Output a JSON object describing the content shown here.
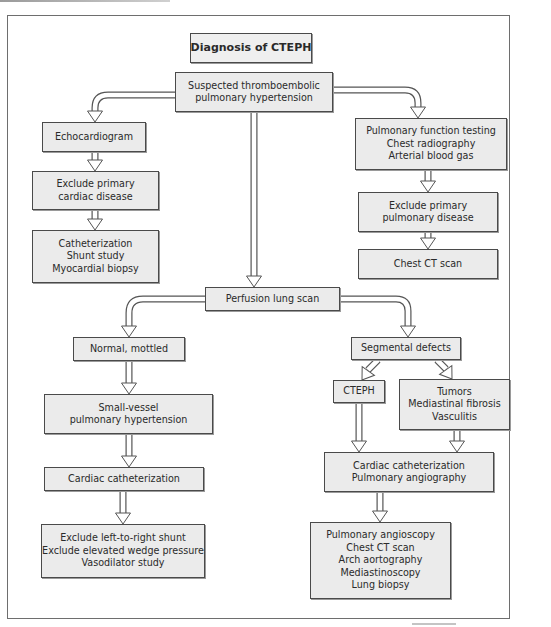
{
  "diagram": {
    "title": "Diagnosis of CTEPH",
    "colors": {
      "box_fill": "#ebebeb",
      "box_border": "#4a4a4a",
      "arrow_stroke": "#555555",
      "arrow_fill": "#ffffff",
      "text": "#2a2a2a"
    },
    "nodes": [
      {
        "id": "title",
        "lines": [
          "Diagnosis of CTEPH"
        ],
        "x": 190,
        "y": 33,
        "w": 122,
        "h": 30
      },
      {
        "id": "suspected",
        "lines": [
          "Suspected thromboembolic",
          "pulmonary hypertension"
        ],
        "x": 175,
        "y": 72,
        "w": 158,
        "h": 40
      },
      {
        "id": "echocardiogram",
        "lines": [
          "Echocardiogram"
        ],
        "x": 42,
        "y": 122,
        "w": 104,
        "h": 30
      },
      {
        "id": "exclude-cardiac",
        "lines": [
          "Exclude primary",
          "cardiac disease"
        ],
        "x": 32,
        "y": 171,
        "w": 127,
        "h": 39
      },
      {
        "id": "catheterization-shunt",
        "lines": [
          "Catheterization",
          "Shunt study",
          "Myocardial biopsy"
        ],
        "x": 32,
        "y": 230,
        "w": 127,
        "h": 53
      },
      {
        "id": "pulmonary-function",
        "lines": [
          "Pulmonary function testing",
          "Chest radiography",
          "Arterial blood gas"
        ],
        "x": 355,
        "y": 118,
        "w": 152,
        "h": 52
      },
      {
        "id": "exclude-pulmonary",
        "lines": [
          "Exclude primary",
          "pulmonary disease"
        ],
        "x": 358,
        "y": 192,
        "w": 140,
        "h": 40
      },
      {
        "id": "chest-ct",
        "lines": [
          "Chest CT scan"
        ],
        "x": 358,
        "y": 249,
        "w": 140,
        "h": 30
      },
      {
        "id": "perfusion-scan",
        "lines": [
          "Perfusion lung scan"
        ],
        "x": 205,
        "y": 287,
        "w": 135,
        "h": 24
      },
      {
        "id": "normal-mottled",
        "lines": [
          "Normal, mottled"
        ],
        "x": 73,
        "y": 337,
        "w": 112,
        "h": 24
      },
      {
        "id": "small-vessel",
        "lines": [
          "Small-vessel",
          "pulmonary hypertension"
        ],
        "x": 44,
        "y": 394,
        "w": 169,
        "h": 40
      },
      {
        "id": "cardiac-cath-left",
        "lines": [
          "Cardiac  catheterization"
        ],
        "x": 44,
        "y": 467,
        "w": 160,
        "h": 24
      },
      {
        "id": "exclude-shunt",
        "lines": [
          "Exclude left-to-right shunt",
          "Exclude elevated wedge pressure",
          "Vasodilator study"
        ],
        "x": 41,
        "y": 524,
        "w": 164,
        "h": 54
      },
      {
        "id": "segmental-defects",
        "lines": [
          "Segmental defects"
        ],
        "x": 351,
        "y": 337,
        "w": 110,
        "h": 23
      },
      {
        "id": "cteph",
        "lines": [
          "CTEPH"
        ],
        "x": 333,
        "y": 380,
        "w": 52,
        "h": 23
      },
      {
        "id": "tumors",
        "lines": [
          "Tumors",
          "Mediastinal fibrosis",
          "Vasculitis"
        ],
        "x": 399,
        "y": 379,
        "w": 111,
        "h": 51
      },
      {
        "id": "cardiac-cath-angio",
        "lines": [
          "Cardiac  catheterization",
          "Pulmonary angiography"
        ],
        "x": 324,
        "y": 452,
        "w": 170,
        "h": 40
      },
      {
        "id": "further-tests",
        "lines": [
          "Pulmonary angioscopy",
          "Chest CT scan",
          "Arch aortography",
          "Mediastinoscopy",
          "Lung biopsy"
        ],
        "x": 310,
        "y": 522,
        "w": 141,
        "h": 77
      }
    ],
    "arrows": [
      {
        "from": "suspected",
        "to": "echocardiogram",
        "path": "M175,95 L108,95 Q95,95 95,108 L95,112",
        "head": [
          95,
          122
        ]
      },
      {
        "from": "suspected",
        "to": "pulmonary-function",
        "path": "M333,90 L405,90 Q418,90 418,103 L418,108",
        "head": [
          418,
          118
        ]
      },
      {
        "from": "suspected",
        "to": "perfusion-scan",
        "path": "M254,112 L254,277",
        "head": [
          254,
          287
        ]
      },
      {
        "from": "echocardiogram",
        "to": "exclude-cardiac",
        "path": "M95,152 L95,161",
        "head": [
          95,
          171
        ]
      },
      {
        "from": "exclude-cardiac",
        "to": "catheterization-shunt",
        "path": "M95,210 L95,220",
        "head": [
          95,
          230
        ]
      },
      {
        "from": "pulmonary-function",
        "to": "exclude-pulmonary",
        "path": "M428,170 L428,182",
        "head": [
          428,
          192
        ]
      },
      {
        "from": "exclude-pulmonary",
        "to": "chest-ct",
        "path": "M428,232 L428,239",
        "head": [
          428,
          249
        ]
      },
      {
        "from": "perfusion-scan",
        "to": "normal-mottled",
        "path": "M205,299 L143,299 Q129,299 129,313 L129,327",
        "head": [
          129,
          337
        ]
      },
      {
        "from": "perfusion-scan",
        "to": "segmental-defects",
        "path": "M340,299 L396,299 Q408,299 408,311 L408,327",
        "head": [
          408,
          337
        ]
      },
      {
        "from": "normal-mottled",
        "to": "small-vessel",
        "path": "M129,361 L129,384",
        "head": [
          129,
          394
        ]
      },
      {
        "from": "small-vessel",
        "to": "cardiac-cath-left",
        "path": "M129,434 L129,457",
        "head": [
          129,
          467
        ]
      },
      {
        "from": "cardiac-cath-left",
        "to": "exclude-shunt",
        "path": "M123,491 L123,514",
        "head": [
          123,
          524
        ]
      },
      {
        "from": "segmental-defects",
        "to": "cteph",
        "path": "M378,360 L368,370",
        "head": [
          362,
          380
        ],
        "angle": 35
      },
      {
        "from": "segmental-defects",
        "to": "tumors",
        "path": "M437,360 L446,369",
        "head": [
          452,
          379
        ],
        "angle": -35
      },
      {
        "from": "cteph",
        "to": "cardiac-cath-angio",
        "path": "M359,403 L359,442",
        "head": [
          359,
          452
        ]
      },
      {
        "from": "tumors",
        "to": "cardiac-cath-angio",
        "path": "M457,430 L457,442",
        "head": [
          457,
          452
        ]
      },
      {
        "from": "cardiac-cath-angio",
        "to": "further-tests",
        "path": "M380,492 L380,512",
        "head": [
          380,
          522
        ]
      }
    ]
  }
}
